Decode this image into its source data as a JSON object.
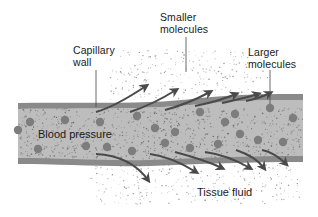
{
  "diagram": {
    "title": "",
    "labels": {
      "capillary_wall": "Capillary\nwall",
      "smaller_molecules": "Smaller\nmolecules",
      "larger_molecules": "Larger\nmolecules",
      "blood_pressure": "Blood pressure",
      "tissue_fluid": "Tissue fluid"
    },
    "colors": {
      "background": "#ffffff",
      "wall": "#8a8a8a",
      "lumen": "#b9b9b9",
      "large_molecule": "#7d7d7d",
      "small_molecule": "#555555",
      "arrow": "#4a4a4a",
      "text": "#1a1a1a"
    },
    "outward_arrows_top": 6,
    "outward_arrows_bottom": 6,
    "large_molecule_count": 22
  }
}
